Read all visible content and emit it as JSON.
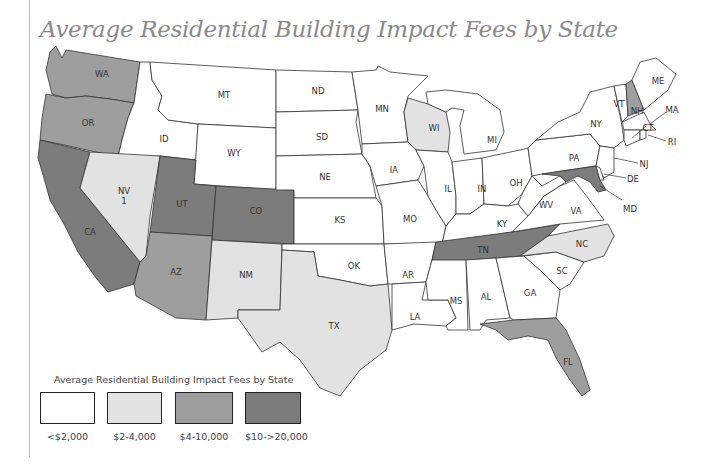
{
  "title": "Average Residential Building Impact Fees by State",
  "legend": {
    "title": "Average Residential Building Impact Fees by State",
    "items": [
      {
        "label": "<$2,000",
        "color": "#ffffff"
      },
      {
        "label": "$2-4,000",
        "color": "#e2e2e2"
      },
      {
        "label": "$4-10,000",
        "color": "#9e9e9e"
      },
      {
        "label": "$10->20,000",
        "color": "#7c7c7c"
      }
    ]
  },
  "states": {
    "WA": {
      "label": "WA",
      "category": 2
    },
    "OR": {
      "label": "OR",
      "category": 2
    },
    "CA": {
      "label": "CA",
      "category": 3
    },
    "ID": {
      "label": "ID",
      "category": 0
    },
    "NV": {
      "label": "NV",
      "sub": "1",
      "category": 1
    },
    "MT": {
      "label": "MT",
      "category": 0
    },
    "WY": {
      "label": "WY",
      "category": 0
    },
    "UT": {
      "label": "UT",
      "category": 3
    },
    "CO": {
      "label": "CO",
      "category": 3
    },
    "AZ": {
      "label": "AZ",
      "category": 2
    },
    "NM": {
      "label": "NM",
      "category": 1
    },
    "ND": {
      "label": "ND",
      "category": 0
    },
    "SD": {
      "label": "SD",
      "category": 0
    },
    "NE": {
      "label": "NE",
      "category": 0
    },
    "KS": {
      "label": "KS",
      "category": 0
    },
    "OK": {
      "label": "OK",
      "category": 0
    },
    "TX": {
      "label": "TX",
      "category": 1
    },
    "MN": {
      "label": "MN",
      "category": 0
    },
    "IA": {
      "label": "IA",
      "category": 0
    },
    "MO": {
      "label": "MO",
      "category": 0
    },
    "AR": {
      "label": "AR",
      "category": 0
    },
    "LA": {
      "label": "LA",
      "category": 0
    },
    "WI": {
      "label": "WI",
      "category": 1
    },
    "IL": {
      "label": "IL",
      "category": 0
    },
    "MI": {
      "label": "MI",
      "category": 0
    },
    "IN": {
      "label": "IN",
      "category": 0
    },
    "OH": {
      "label": "OH",
      "category": 0
    },
    "KY": {
      "label": "KY",
      "category": 0
    },
    "TN": {
      "label": "TN",
      "category": 3
    },
    "MS": {
      "label": "MS",
      "category": 0
    },
    "AL": {
      "label": "AL",
      "category": 0
    },
    "GA": {
      "label": "GA",
      "category": 0
    },
    "FL": {
      "label": "FL",
      "category": 2
    },
    "SC": {
      "label": "SC",
      "category": 0
    },
    "NC": {
      "label": "NC",
      "category": 1
    },
    "VA": {
      "label": "VA",
      "category": 0
    },
    "WV": {
      "label": "WV",
      "category": 0
    },
    "PA": {
      "label": "PA",
      "category": 0
    },
    "NY": {
      "label": "NY",
      "category": 0
    },
    "VT": {
      "label": "VT",
      "category": 0
    },
    "NH": {
      "label": "NH",
      "category": 2
    },
    "ME": {
      "label": "ME",
      "category": 0
    },
    "MA": {
      "label": "MA",
      "category": 0
    },
    "RI": {
      "label": "RI",
      "category": 0
    },
    "CT": {
      "label": "CT",
      "category": 0
    },
    "NJ": {
      "label": "NJ",
      "category": 0
    },
    "DE": {
      "label": "DE",
      "category": 0
    },
    "MD": {
      "label": "MD",
      "category": 3
    }
  }
}
